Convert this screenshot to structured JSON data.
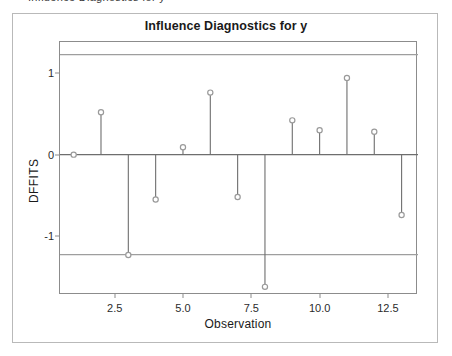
{
  "figure": {
    "title": "Influence Diagnostics for y",
    "top_ghost_text": "Influence Diagnostics for y"
  },
  "chart_data": {
    "type": "scatter",
    "plot_style": "stem-with-open-circle-markers",
    "title": "Influence Diagnostics for y",
    "xlabel": "Observation",
    "ylabel": "DFFITS",
    "x": [
      1,
      2,
      3,
      4,
      5,
      6,
      7,
      8,
      9,
      10,
      11,
      12,
      13
    ],
    "values": [
      0.0,
      0.52,
      -1.23,
      -0.55,
      0.09,
      0.76,
      -0.52,
      -1.62,
      0.42,
      0.3,
      0.94,
      0.28,
      -0.74
    ],
    "series": [
      {
        "name": "DFFITS",
        "values": [
          0.0,
          0.52,
          -1.23,
          -0.55,
          0.09,
          0.76,
          -0.52,
          -1.62,
          0.42,
          0.3,
          0.94,
          0.28,
          -0.74
        ]
      }
    ],
    "baseline": 0,
    "reference_lines": [
      1.226,
      -1.226
    ],
    "xlim": [
      0.5,
      13.6
    ],
    "ylim": [
      -1.72,
      1.38
    ],
    "xticks": [
      2.5,
      5.0,
      7.5,
      10.0,
      12.5
    ],
    "xticklabels": [
      "2.5",
      "5.0",
      "7.5",
      "10.0",
      "12.5"
    ],
    "yticks": [
      1,
      0,
      -1
    ],
    "yticklabels": [
      "1",
      "0",
      "-1"
    ],
    "grid": false,
    "legend": null,
    "marker_color": "#9a9a9a",
    "line_color": "#6e6e6e",
    "reference_line_color": "#9e9e9e",
    "axis_color": "#8c8c8c"
  }
}
